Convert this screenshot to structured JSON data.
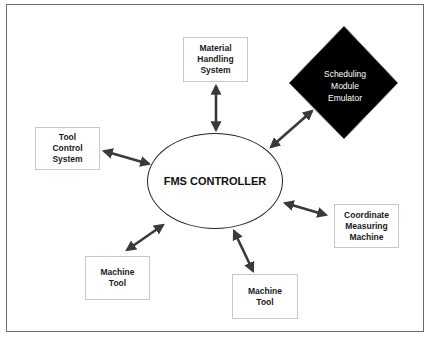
{
  "diagram": {
    "center": {
      "label": "FMS CONTROLLER"
    },
    "nodes": [
      {
        "id": "material-handling",
        "lines": [
          "Material",
          "Handling",
          "System"
        ],
        "shape": "box"
      },
      {
        "id": "scheduling-emulator",
        "lines": [
          "Scheduling",
          "Module",
          "Emulator"
        ],
        "shape": "diamond",
        "fill": "#000000",
        "text_color": "#ffffff"
      },
      {
        "id": "tool-control",
        "lines": [
          "Tool",
          "Control",
          "System"
        ],
        "shape": "box"
      },
      {
        "id": "coordinate-measuring",
        "lines": [
          "Coordinate",
          "Measuring",
          "Machine"
        ],
        "shape": "box"
      },
      {
        "id": "machine-tool-1",
        "lines": [
          "Machine",
          "Tool"
        ],
        "shape": "box"
      },
      {
        "id": "machine-tool-2",
        "lines": [
          "Machine",
          "Tool"
        ],
        "shape": "box"
      }
    ],
    "edges": [
      {
        "from": "FMS CONTROLLER",
        "to": "Material Handling System",
        "type": "bidirectional"
      },
      {
        "from": "FMS CONTROLLER",
        "to": "Scheduling Module Emulator",
        "type": "bidirectional"
      },
      {
        "from": "FMS CONTROLLER",
        "to": "Tool Control System",
        "type": "bidirectional"
      },
      {
        "from": "FMS CONTROLLER",
        "to": "Coordinate Measuring Machine",
        "type": "bidirectional"
      },
      {
        "from": "FMS CONTROLLER",
        "to": "Machine Tool",
        "type": "bidirectional"
      },
      {
        "from": "FMS CONTROLLER",
        "to": "Machine Tool",
        "type": "bidirectional"
      }
    ]
  },
  "colors": {
    "arrow": "#3a3a3a",
    "frame": "#6b6b6b",
    "box_border": "#c8c8c8",
    "diamond": "#000000"
  }
}
